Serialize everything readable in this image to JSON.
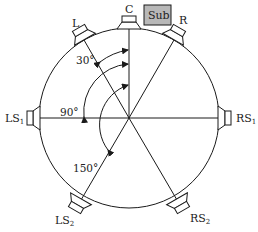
{
  "diagram": {
    "title": "",
    "speakers": [
      {
        "id": "C",
        "label": "C",
        "angle_deg": 0
      },
      {
        "id": "L",
        "label": "L",
        "angle_deg": -30
      },
      {
        "id": "R",
        "label": "R",
        "angle_deg": 30
      },
      {
        "id": "LS1",
        "label": "LS",
        "subscript": "1",
        "angle_deg": -90
      },
      {
        "id": "RS1",
        "label": "RS",
        "subscript": "1",
        "angle_deg": 90
      },
      {
        "id": "LS2",
        "label": "LS",
        "subscript": "2",
        "angle_deg": -150
      },
      {
        "id": "RS2",
        "label": "RS",
        "subscript": "2",
        "angle_deg": 150
      }
    ],
    "subwoofer": {
      "label": "Sub"
    },
    "angle_labels": [
      {
        "text": "30°"
      },
      {
        "text": "90°"
      },
      {
        "text": "150°"
      }
    ],
    "colors": {
      "line": "#1a1a1a",
      "sub_fill": "#b8b8b8",
      "background": "#ffffff"
    }
  }
}
